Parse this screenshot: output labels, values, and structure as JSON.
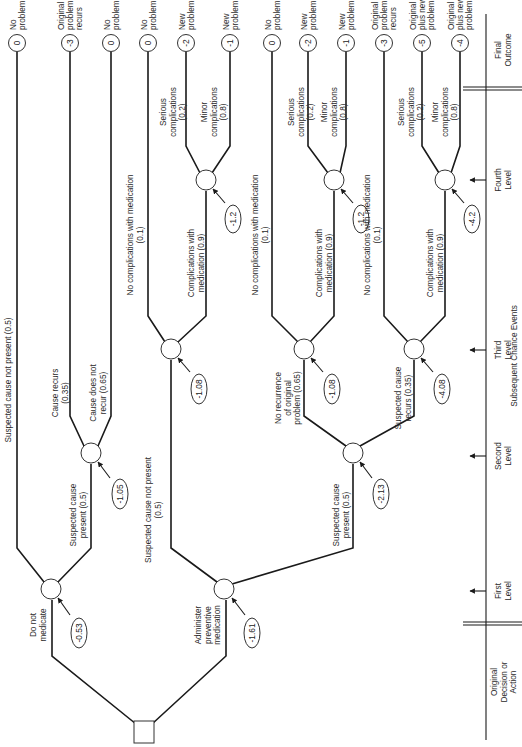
{
  "outcomes": [
    {
      "value": "0",
      "label": [
        "No",
        "problem"
      ]
    },
    {
      "value": "-3",
      "label": [
        "Original",
        "problem",
        "recurs"
      ]
    },
    {
      "value": "0",
      "label": [
        "No",
        "problem"
      ]
    },
    {
      "value": "0",
      "label": [
        "No",
        "problem"
      ]
    },
    {
      "value": "-2",
      "label": [
        "New",
        "problem"
      ]
    },
    {
      "value": "-1",
      "label": [
        "New",
        "problem"
      ]
    },
    {
      "value": "0",
      "label": [
        "No",
        "problem"
      ]
    },
    {
      "value": "-2",
      "label": [
        "New",
        "problem"
      ]
    },
    {
      "value": "-1",
      "label": [
        "New",
        "problem"
      ]
    },
    {
      "value": "-3",
      "label": [
        "Original",
        "problem",
        "recurs"
      ]
    },
    {
      "value": "-5",
      "label": [
        "Original",
        "plus new",
        "problems"
      ]
    },
    {
      "value": "-4",
      "label": [
        "Original",
        "plus new",
        "problems"
      ]
    }
  ],
  "node_values": {
    "do_not_medicate": "-0.53",
    "administer": "-1.61",
    "cause_node": "-1.05",
    "level2_med": "-2.13",
    "l3_a": "-1.08",
    "l3_b": "-1.08",
    "l3_c": "-4.08",
    "l4_a": "-1.2",
    "l4_b": "-1.2",
    "l4_c": "-4.2"
  },
  "branches": {
    "do_not_medicate": [
      "Do not",
      "medicate"
    ],
    "administer": [
      "Administer",
      "preventive",
      "medication"
    ],
    "susp_not_present_top": [
      "Suspected cause not present (0.5)"
    ],
    "susp_present_a": [
      "Suspected cause",
      "present (0.5)"
    ],
    "cause_recurs": [
      "Cause recurs",
      "(0.35)"
    ],
    "cause_not_recur": [
      "Cause does not",
      "recur (0.65)"
    ],
    "susp_not_present_b": [
      "Suspected cause not present",
      "(0.5)"
    ],
    "susp_present_b": [
      "Suspected cause",
      "present (0.5)"
    ],
    "no_recurrence": [
      "No recurrence",
      "of original",
      "problem (0.65)"
    ],
    "susp_recurs": [
      "Suspected cause",
      "recurs (0.35)"
    ],
    "no_comp": [
      "No complications with medication",
      "(0.1)"
    ],
    "comp": [
      "Complications with",
      "medication (0.9)"
    ],
    "serious": [
      "Serious",
      "complications",
      "(0.2)"
    ],
    "minor": [
      "Minor",
      "complications",
      "(0.8)"
    ]
  },
  "axis": {
    "original": [
      "Original",
      "Decision or",
      "Action"
    ],
    "first": [
      "First",
      "Level"
    ],
    "second": [
      "Second",
      "Level"
    ],
    "third": [
      "Third",
      "Level"
    ],
    "fourth": [
      "Fourth",
      "Level"
    ],
    "final": [
      "Final",
      "Outcome"
    ],
    "subsequent": "Subsequent Chance Events"
  }
}
